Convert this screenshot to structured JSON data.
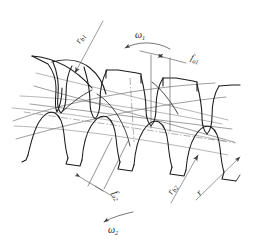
{
  "figure": {
    "background_color": "#ffffff",
    "line_color": "#1a1a1a",
    "construction_color": "#5d5d5d"
  },
  "labels": {
    "r_b1": {
      "symbol": "r",
      "subscript": "b1",
      "meaning": "base circle radius of gear 1",
      "rotation_deg": -70
    },
    "omega_1": {
      "symbol": "ω",
      "subscript": "1",
      "meaning": "angular velocity of gear 1",
      "rotation_deg": 0
    },
    "f_a1": {
      "symbol": "f",
      "subscript": "a1",
      "meaning": "tip contact dimension of gear 1",
      "rotation_deg": 20
    },
    "f_a2": {
      "symbol": "f",
      "subscript": "a2",
      "meaning": "tip contact dimension of gear 2",
      "rotation_deg": 62
    },
    "r_b2": {
      "symbol": "r",
      "subscript": "b2",
      "meaning": "base circle radius of gear 2",
      "rotation_deg": -66
    },
    "r": {
      "symbol": "r",
      "subscript": "",
      "meaning": "pitch radius",
      "rotation_deg": -60
    },
    "omega_2": {
      "symbol": "ω",
      "subscript": "2",
      "meaning": "angular velocity of gear 2",
      "rotation_deg": 0
    }
  },
  "gears": {
    "upper": {
      "name": "gear-1",
      "tooth_direction": "down",
      "tooth_count_visible": 4,
      "rotation_label": "ω₁"
    },
    "lower": {
      "name": "gear-2",
      "tooth_direction": "up",
      "tooth_count_visible": 4,
      "rotation_label": "ω₂"
    }
  },
  "annotations": {
    "rotation_arrow_upper": "counter-clockwise arc arrow at top",
    "rotation_arrow_lower": "counter-clockwise arc arrow at bottom",
    "line_of_action": "inclined straight lines crossing the mesh region",
    "pitch_line": "dash-dot center line through mesh"
  }
}
